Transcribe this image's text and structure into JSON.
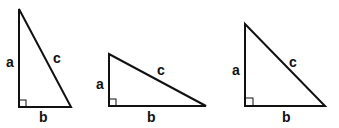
{
  "triangles": [
    {
      "name": "triangle-1",
      "points": {
        "top": [
          19,
          9
        ],
        "right_angle": [
          19,
          107
        ],
        "right": [
          71,
          107
        ]
      },
      "labels": {
        "a": "a",
        "b": "b",
        "c": "c"
      },
      "label_pos": {
        "a": [
          6,
          67
        ],
        "b": [
          39,
          122
        ],
        "c": [
          53,
          63
        ]
      }
    },
    {
      "name": "triangle-2",
      "points": {
        "top": [
          109,
          54
        ],
        "right_angle": [
          109,
          106
        ],
        "right": [
          206,
          106
        ]
      },
      "labels": {
        "a": "a",
        "b": "b",
        "c": "c"
      },
      "label_pos": {
        "a": [
          96,
          89
        ],
        "b": [
          147,
          122
        ],
        "c": [
          157,
          75
        ]
      }
    },
    {
      "name": "triangle-3",
      "points": {
        "top": [
          245,
          24
        ],
        "right_angle": [
          245,
          106
        ],
        "right": [
          325,
          106
        ]
      },
      "labels": {
        "a": "a",
        "b": "b",
        "c": "c"
      },
      "label_pos": {
        "a": [
          232,
          75
        ],
        "b": [
          282,
          122
        ],
        "c": [
          289,
          67
        ]
      }
    }
  ],
  "colors": {
    "stroke": "#111111",
    "background": "#ffffff"
  }
}
